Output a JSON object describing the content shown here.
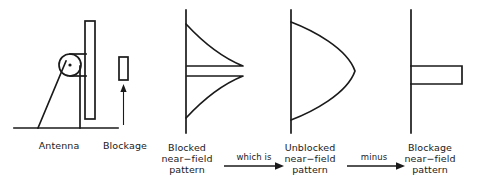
{
  "figure": {
    "stroke_color": "#1a1a1a",
    "background_color": "#ffffff"
  },
  "antenna_diagram": {
    "antenna_label": "Antenna",
    "blockage_label": "Blockage",
    "parts": {
      "reflector": "reflector-panel",
      "feed": "feed-horn-circle",
      "feed_center": "feed-center-dot",
      "strut": "support-strut",
      "mast": "vertical-mast",
      "ground": "ground-line",
      "blocker": "blockage-rectangle",
      "pointer": "blockage-pointer-arrow"
    }
  },
  "patterns": [
    {
      "id": "blocked",
      "shape": "bell-with-notch",
      "label_lines": [
        "Blocked",
        "near−field",
        "pattern"
      ]
    },
    {
      "id": "unblocked",
      "shape": "bell",
      "label_lines": [
        "Unblocked",
        "near−field",
        "pattern"
      ]
    },
    {
      "id": "blockage",
      "shape": "rectangular-lobe",
      "label_lines": [
        "Blockage",
        "near−field",
        "pattern"
      ]
    }
  ],
  "connectors": [
    {
      "id": "which-is",
      "label": "which is"
    },
    {
      "id": "minus",
      "label": "minus"
    }
  ]
}
